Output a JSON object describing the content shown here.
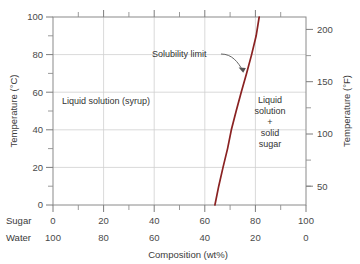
{
  "chart_data": {
    "type": "line",
    "title": "",
    "xlabel": "Composition (wt%)",
    "ylabel_left": "Temperature (°C)",
    "ylabel_right": "Temperature (°F)",
    "xlim": [
      0,
      100
    ],
    "ylim_left": [
      0,
      100
    ],
    "ylim_right": [
      32,
      212
    ],
    "grid": true,
    "legend_position": "none",
    "x_axis": {
      "row_labels": [
        "Sugar",
        "Water"
      ],
      "sugar_ticks": [
        "0",
        "20",
        "40",
        "60",
        "80",
        "100"
      ],
      "water_ticks": [
        "100",
        "80",
        "60",
        "40",
        "20",
        "0"
      ],
      "major_step": 20,
      "minor_step": 10
    },
    "y_axis_left": {
      "ticks": [
        "0",
        "20",
        "40",
        "60",
        "80",
        "100"
      ],
      "minor_step": 10,
      "unit": "°C"
    },
    "y_axis_right": {
      "ticks": [
        "50",
        "100",
        "150",
        "200"
      ],
      "minor_step": 10,
      "unit": "°F"
    },
    "series": [
      {
        "name": "Solubility limit",
        "color": "#8a2222",
        "points": [
          {
            "sugar_wt": 64.0,
            "temp_c": 0
          },
          {
            "sugar_wt": 65.5,
            "temp_c": 10
          },
          {
            "sugar_wt": 67.2,
            "temp_c": 20
          },
          {
            "sugar_wt": 69.0,
            "temp_c": 30
          },
          {
            "sugar_wt": 70.5,
            "temp_c": 40
          },
          {
            "sugar_wt": 72.4,
            "temp_c": 50
          },
          {
            "sugar_wt": 74.4,
            "temp_c": 60
          },
          {
            "sugar_wt": 76.5,
            "temp_c": 70
          },
          {
            "sugar_wt": 78.5,
            "temp_c": 80
          },
          {
            "sugar_wt": 80.3,
            "temp_c": 90
          },
          {
            "sugar_wt": 81.5,
            "temp_c": 100
          }
        ]
      }
    ],
    "annotations": [
      {
        "name": "solubility-limit",
        "text": "Solubility limit",
        "target_sugar_wt": 72.0,
        "target_temp_c": 65
      },
      {
        "name": "left-region",
        "text": "Liquid solution (syrup)",
        "sugar_wt": 22,
        "temp_c": 55
      },
      {
        "name": "right-region",
        "text": "Liquid solution + solid sugar",
        "lines": [
          "Liquid",
          "solution",
          "+",
          "solid",
          "sugar"
        ],
        "sugar_wt": 87,
        "temp_c": 45
      }
    ]
  },
  "labels": {
    "y_left_title": "Temperature (°C)",
    "y_right_title": "Temperature (°F)",
    "x_title": "Composition (wt%)",
    "row_sugar": "Sugar",
    "row_water": "Water",
    "region_left": "Liquid solution (syrup)",
    "region_right_l1": "Liquid",
    "region_right_l2": "solution",
    "region_right_l3": "+",
    "region_right_l4": "solid",
    "region_right_l5": "sugar",
    "annotation_solubility": "Solubility limit",
    "yl_0": "0",
    "yl_20": "20",
    "yl_40": "40",
    "yl_60": "60",
    "yl_80": "80",
    "yl_100": "100",
    "yr_50": "50",
    "yr_100": "100",
    "yr_150": "150",
    "yr_200": "200",
    "xs_0": "0",
    "xs_20": "20",
    "xs_40": "40",
    "xs_60": "60",
    "xs_80": "80",
    "xs_100": "100",
    "xw_100": "100",
    "xw_80": "80",
    "xw_60": "60",
    "xw_40": "40",
    "xw_20": "20",
    "xw_0": "0"
  },
  "colors": {
    "curve": "#8a2222",
    "grid": "#cfcfcf",
    "frame": "#8a8a8a",
    "text": "#3a3a3a",
    "background": "#ffffff"
  }
}
